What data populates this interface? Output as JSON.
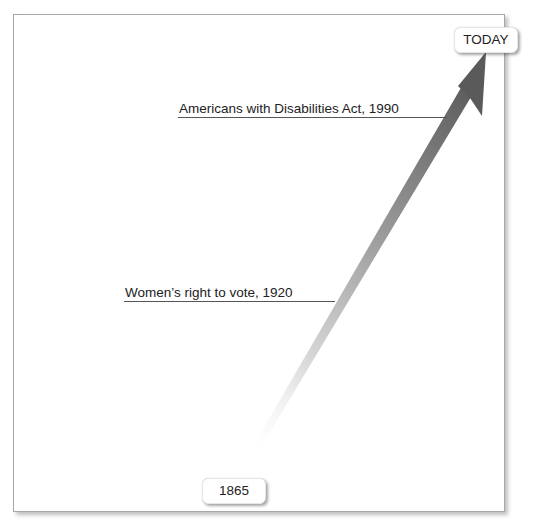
{
  "timeline": {
    "end_label": "TODAY",
    "start_label": "1865",
    "events": [
      {
        "label": "Americans with Disabilities Act, 1990"
      },
      {
        "label": "Women’s right to vote, 1920"
      }
    ]
  },
  "colors": {
    "arrow_dark": "#5a5a5a",
    "arrow_light": "#ffffff",
    "leader_line": "#555555",
    "frame_border": "#a8a8a8"
  }
}
